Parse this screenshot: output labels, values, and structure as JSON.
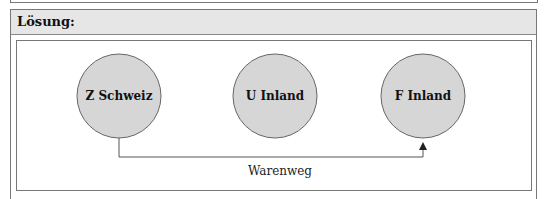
{
  "header": {
    "title": "Lösung:"
  },
  "diagram": {
    "nodes": [
      {
        "id": "z",
        "label": "Z Schweiz",
        "cx": 119,
        "cy": 96,
        "r": 43
      },
      {
        "id": "u",
        "label": "U Inland",
        "cx": 275,
        "cy": 96,
        "r": 43
      },
      {
        "id": "f",
        "label": "F Inland",
        "cx": 423,
        "cy": 96,
        "r": 43
      }
    ],
    "edge": {
      "from": "Z Schweiz",
      "to": "F Inland",
      "label": "Warenweg"
    },
    "colors": {
      "node_fill": "#d6d6d6",
      "node_stroke": "#666666",
      "line": "#555555",
      "header_bg": "#e6e6e6"
    }
  }
}
